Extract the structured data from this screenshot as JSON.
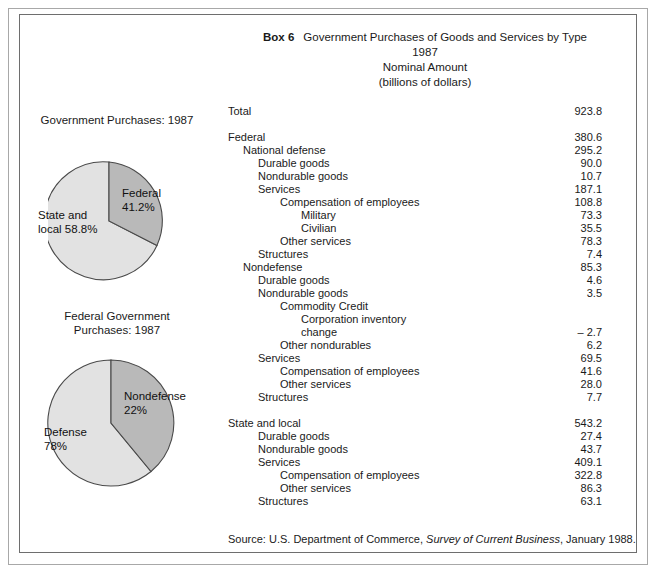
{
  "box": {
    "label": "Box 6",
    "title": "Government Purchases of Goods and Services by Type",
    "year": "1987",
    "subtitle": "Nominal Amount",
    "units": "(billions of dollars)"
  },
  "source": {
    "prefix": "Source:  U.S. Department of Commerce,",
    "publication": "Survey of Current Business",
    "suffix": ", January 1988."
  },
  "chart_data": [
    {
      "type": "pie",
      "id": "government-purchases-1987",
      "title": "Government Purchases:  1987",
      "categories": [
        "Federal",
        "State and local"
      ],
      "values": [
        41.2,
        58.8
      ],
      "labels": [
        "Federal\n41.2%",
        "State and\nlocal 58.8%"
      ],
      "label_lines": [
        [
          "Federal",
          "41.2%"
        ],
        [
          "State and",
          "local 58.8%"
        ]
      ],
      "colors": [
        "#b9b9b9",
        "#e2e2e2"
      ],
      "start_angle_deg": 0,
      "direction": "clockwise",
      "units": "percent"
    },
    {
      "type": "pie",
      "id": "federal-government-purchases-1987",
      "title_lines": [
        "Federal Government",
        "Purchases: 1987"
      ],
      "title": "Federal Government Purchases: 1987",
      "categories": [
        "Nondefense",
        "Defense"
      ],
      "values": [
        22,
        78
      ],
      "labels": [
        "Nondefense\n22%",
        "Defense\n78%"
      ],
      "label_lines": [
        [
          "Nondefense",
          "22%"
        ],
        [
          "Defense",
          "78%"
        ]
      ],
      "colors": [
        "#b9b9b9",
        "#e2e2e2"
      ],
      "start_angle_deg": 0,
      "direction": "clockwise",
      "units": "percent"
    },
    {
      "type": "table",
      "id": "government-purchases-by-type-1987",
      "title": "Government Purchases of Goods and Services by Type",
      "units": "billions of dollars",
      "columns": [
        "Category",
        "Nominal Amount"
      ],
      "rows": [
        {
          "indent": 0,
          "label": "Total",
          "value": "923.8"
        },
        {
          "spacer": true
        },
        {
          "indent": 0,
          "label": "Federal",
          "value": "380.6"
        },
        {
          "indent": 1,
          "label": "National defense",
          "value": "295.2"
        },
        {
          "indent": 2,
          "label": "Durable goods",
          "value": "90.0"
        },
        {
          "indent": 2,
          "label": "Nondurable goods",
          "value": "10.7"
        },
        {
          "indent": 2,
          "label": "Services",
          "value": "187.1"
        },
        {
          "indent": 3,
          "label": "Compensation of employees",
          "value": "108.8"
        },
        {
          "indent": 4,
          "label": "Military",
          "value": "73.3"
        },
        {
          "indent": 4,
          "label": "Civilian",
          "value": "35.5"
        },
        {
          "indent": 3,
          "label": "Other services",
          "value": "78.3"
        },
        {
          "indent": 2,
          "label": "Structures",
          "value": "7.4"
        },
        {
          "indent": 1,
          "label": "Nondefense",
          "value": "85.3"
        },
        {
          "indent": 2,
          "label": "Durable goods",
          "value": "4.6"
        },
        {
          "indent": 2,
          "label": "Nondurable goods",
          "value": "3.5"
        },
        {
          "indent": 3,
          "label": "Commodity Credit",
          "value": ""
        },
        {
          "indent": 4,
          "label": "Corporation inventory",
          "value": ""
        },
        {
          "indent": 4,
          "label": "change",
          "value": "– 2.7"
        },
        {
          "indent": 3,
          "label": "Other nondurables",
          "value": "6.2"
        },
        {
          "indent": 2,
          "label": "Services",
          "value": "69.5"
        },
        {
          "indent": 3,
          "label": "Compensation of employees",
          "value": "41.6"
        },
        {
          "indent": 3,
          "label": "Other services",
          "value": "28.0"
        },
        {
          "indent": 2,
          "label": "Structures",
          "value": "7.7"
        },
        {
          "spacer": true
        },
        {
          "indent": 0,
          "label": "State and local",
          "value": "543.2"
        },
        {
          "indent": 2,
          "label": "Durable goods",
          "value": "27.4"
        },
        {
          "indent": 2,
          "label": "Nondurable goods",
          "value": "43.7"
        },
        {
          "indent": 2,
          "label": "Services",
          "value": "409.1"
        },
        {
          "indent": 3,
          "label": "Compensation of employees",
          "value": "322.8"
        },
        {
          "indent": 3,
          "label": "Other services",
          "value": "86.3"
        },
        {
          "indent": 2,
          "label": "Structures",
          "value": "63.1"
        }
      ]
    }
  ]
}
